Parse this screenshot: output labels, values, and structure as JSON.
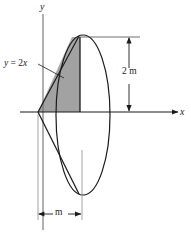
{
  "figure": {
    "type": "engineering-diagram",
    "axes": {
      "y_label": "y",
      "x_label": "x"
    },
    "annotations": {
      "equation": {
        "lhs": "y",
        "operator": "=",
        "rhs_coefficient": "2",
        "rhs_variable": "x",
        "full": "y = 2x"
      },
      "vertical_dimension": "2 m",
      "horizontal_dimension": "m"
    },
    "caption": "",
    "colors": {
      "line": "#1a1a1a",
      "shading": "#a8a8a8",
      "background": "#ffffff",
      "text": "#1a1a1a"
    },
    "geometry": {
      "origin": {
        "x": 38,
        "y": 112
      },
      "ellipse": {
        "cx": 83,
        "cy": 115,
        "rx": 27,
        "ry": 80
      },
      "apex": {
        "x": 38,
        "y": 112
      },
      "shaded_strip_x": 80,
      "vertical_dim_line_x": 129,
      "vertical_dim_top_y": 38,
      "vertical_dim_bottom_y": 112,
      "horizontal_dim_y": 214,
      "horizontal_dim_left_x": 38,
      "horizontal_dim_right_x": 82
    }
  }
}
